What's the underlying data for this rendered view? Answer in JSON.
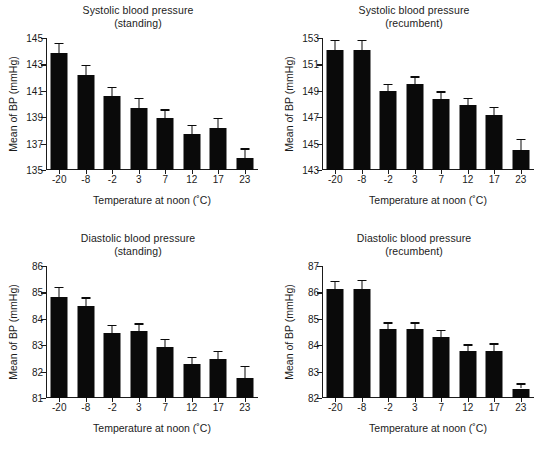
{
  "figure": {
    "background": "#ffffff",
    "ink_color": "#0a0a0a",
    "bar_color": "#0a0a0a"
  },
  "chart_data": [
    {
      "type": "bar",
      "panel_index": 0,
      "title": "Systolic blood pressure",
      "subtitle": "(standing)",
      "xlabel": "Temperature at noon (˚C)",
      "ylabel": "Mean of BP (mmHg)",
      "categories": [
        "-20",
        "-8",
        "-2",
        "3",
        "7",
        "12",
        "17",
        "23"
      ],
      "values": [
        143.9,
        142.2,
        140.6,
        139.7,
        138.95,
        137.75,
        138.2,
        135.9
      ],
      "errors": [
        0.75,
        0.75,
        0.7,
        0.75,
        0.65,
        0.65,
        0.75,
        0.75
      ],
      "yticks": [
        135,
        137,
        139,
        141,
        143,
        145
      ],
      "ylim": [
        135,
        145
      ],
      "grid": false,
      "legend": "none"
    },
    {
      "type": "bar",
      "panel_index": 1,
      "title": "Systolic blood pressure",
      "subtitle": "(recumbent)",
      "xlabel": "Temperature at noon (˚C)",
      "ylabel": "Mean of BP (mmHg)",
      "categories": [
        "-20",
        "-8",
        "-2",
        "3",
        "7",
        "12",
        "17",
        "23"
      ],
      "values": [
        152.1,
        152.1,
        148.95,
        149.5,
        148.4,
        147.9,
        147.2,
        144.5
      ],
      "errors": [
        0.75,
        0.75,
        0.6,
        0.6,
        0.55,
        0.55,
        0.6,
        0.85
      ],
      "yticks": [
        143,
        145,
        147,
        149,
        151,
        153
      ],
      "ylim": [
        143,
        153
      ],
      "grid": false,
      "legend": "none"
    },
    {
      "type": "bar",
      "panel_index": 2,
      "title": "Diastolic blood pressure",
      "subtitle": "(standing)",
      "xlabel": "Temperature at noon (˚C)",
      "ylabel": "Mean of BP (mmHg)",
      "categories": [
        "-20",
        "-8",
        "-2",
        "3",
        "7",
        "12",
        "17",
        "23"
      ],
      "values": [
        84.82,
        84.48,
        83.47,
        83.55,
        82.95,
        82.28,
        82.48,
        81.74
      ],
      "errors": [
        0.38,
        0.33,
        0.3,
        0.28,
        0.3,
        0.27,
        0.3,
        0.48
      ],
      "yticks": [
        81,
        82,
        83,
        84,
        85,
        86
      ],
      "ylim": [
        81,
        86
      ],
      "grid": false,
      "legend": "none"
    },
    {
      "type": "bar",
      "panel_index": 3,
      "title": "Diastolic blood pressure",
      "subtitle": "(recumbent)",
      "xlabel": "Temperature at noon (˚C)",
      "ylabel": "Mean of BP (mmHg)",
      "categories": [
        "-20",
        "-8",
        "-2",
        "3",
        "7",
        "12",
        "17",
        "23"
      ],
      "values": [
        86.12,
        86.12,
        84.63,
        84.63,
        84.32,
        83.79,
        83.79,
        82.36
      ],
      "errors": [
        0.33,
        0.36,
        0.24,
        0.24,
        0.26,
        0.24,
        0.28,
        0.2
      ],
      "yticks": [
        82,
        83,
        84,
        85,
        86,
        87
      ],
      "ylim": [
        82,
        87
      ],
      "grid": false,
      "legend": "none"
    }
  ]
}
